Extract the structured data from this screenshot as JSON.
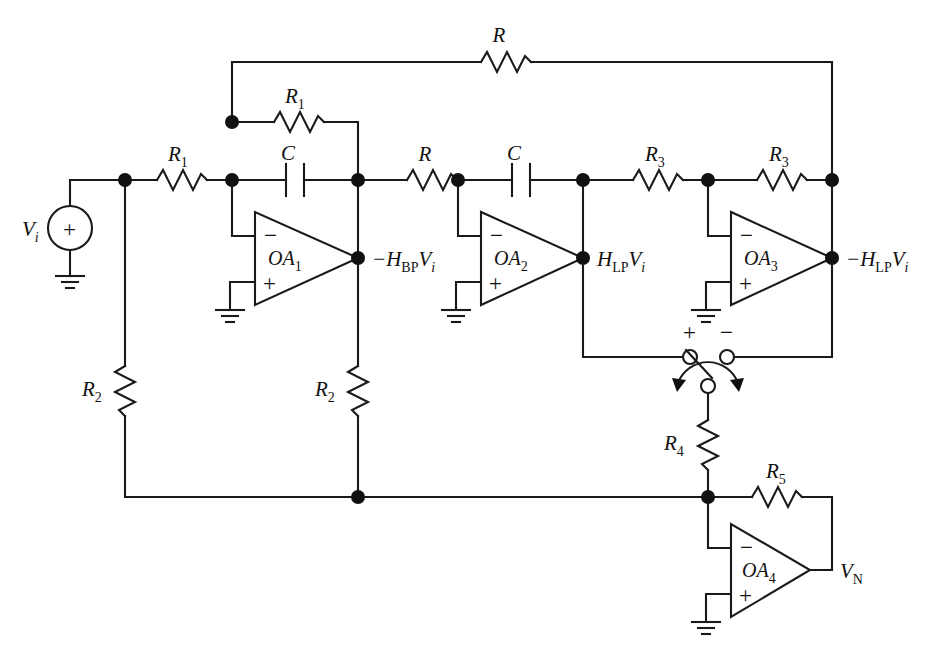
{
  "figure": {
    "type": "circuit-schematic",
    "background": "#ffffff",
    "ink": "#1a1a1a",
    "width": 931,
    "height": 666
  },
  "source": {
    "name": "input-voltage-source",
    "label": "V",
    "label_sub": "i",
    "polarity": "+",
    "grounded": true
  },
  "opamps": [
    {
      "id": "OA1",
      "label": "OA",
      "sub": "1",
      "inv_input": "−",
      "noninv_input": "+",
      "output_label": "−H",
      "output_sub": "BP",
      "output_tail": "V",
      "output_tail_sub": "i"
    },
    {
      "id": "OA2",
      "label": "OA",
      "sub": "2",
      "inv_input": "−",
      "noninv_input": "+",
      "output_label": "H",
      "output_sub": "LP",
      "output_tail": "V",
      "output_tail_sub": "i"
    },
    {
      "id": "OA3",
      "label": "OA",
      "sub": "3",
      "inv_input": "−",
      "noninv_input": "+",
      "output_label": "−H",
      "output_sub": "LP",
      "output_tail": "V",
      "output_tail_sub": "i"
    },
    {
      "id": "OA4",
      "label": "OA",
      "sub": "4",
      "inv_input": "−",
      "noninv_input": "+",
      "output_label": "V",
      "output_sub": "N",
      "output_tail": "",
      "output_tail_sub": ""
    }
  ],
  "components": {
    "resistors": [
      {
        "id": "R-top-feedback",
        "label": "R",
        "sub": "",
        "orientation": "horizontal"
      },
      {
        "id": "R1-feedback-oa1",
        "label": "R",
        "sub": "1",
        "orientation": "horizontal"
      },
      {
        "id": "R1-input-series",
        "label": "R",
        "sub": "1",
        "orientation": "horizontal"
      },
      {
        "id": "R-series-oa1-oa2",
        "label": "R",
        "sub": "",
        "orientation": "horizontal"
      },
      {
        "id": "R3-feedback-oa3",
        "label": "R",
        "sub": "3",
        "orientation": "horizontal"
      },
      {
        "id": "R3-input-oa3",
        "label": "R",
        "sub": "3",
        "orientation": "horizontal"
      },
      {
        "id": "R2-left-shunt",
        "label": "R",
        "sub": "2",
        "orientation": "vertical"
      },
      {
        "id": "R2-mid-shunt",
        "label": "R",
        "sub": "2",
        "orientation": "vertical"
      },
      {
        "id": "R4-switch-series",
        "label": "R",
        "sub": "4",
        "orientation": "vertical"
      },
      {
        "id": "R5-feedback-oa4",
        "label": "R",
        "sub": "5",
        "orientation": "horizontal"
      }
    ],
    "capacitors": [
      {
        "id": "C-feedback-oa1",
        "label": "C",
        "orientation": "horizontal"
      },
      {
        "id": "C-series-oa2",
        "label": "C",
        "orientation": "horizontal"
      }
    ],
    "grounds": [
      {
        "id": "ground-source"
      },
      {
        "id": "ground-oa1"
      },
      {
        "id": "ground-oa2"
      },
      {
        "id": "ground-oa3"
      },
      {
        "id": "ground-oa4"
      }
    ],
    "switch": {
      "id": "polarity-selector-switch",
      "type": "spdt-rotary",
      "terminal_left_label": "+",
      "terminal_right_label": "−",
      "pole_position": "center",
      "rotatable": true
    }
  },
  "node_labels": [
    {
      "id": "oa1-output",
      "text": "−H",
      "sub": "BP",
      "tail": "V",
      "tail_sub": "i"
    },
    {
      "id": "oa2-output",
      "text": "H",
      "sub": "LP",
      "tail": "V",
      "tail_sub": "i"
    },
    {
      "id": "oa3-output",
      "text": "−H",
      "sub": "LP",
      "tail": "V",
      "tail_sub": "i"
    },
    {
      "id": "oa4-output",
      "text": "V",
      "sub": "N",
      "tail": "",
      "tail_sub": ""
    }
  ],
  "labels": {
    "source": "V",
    "source_sub": "i",
    "R": "R",
    "R1": "R",
    "R1_sub": "1",
    "R2": "R",
    "R2_sub": "2",
    "R3": "R",
    "R3_sub": "3",
    "R4": "R",
    "R4_sub": "4",
    "R5": "R",
    "R5_sub": "5",
    "C": "C",
    "plus": "+",
    "minus": "−",
    "OA": "OA",
    "HBP": "−H",
    "BP": "BP",
    "HLP": "H",
    "LP": "LP",
    "nHLP": "−H",
    "Vi": "V",
    "Vi_sub": "i",
    "VN": "V",
    "VN_sub": "N"
  }
}
